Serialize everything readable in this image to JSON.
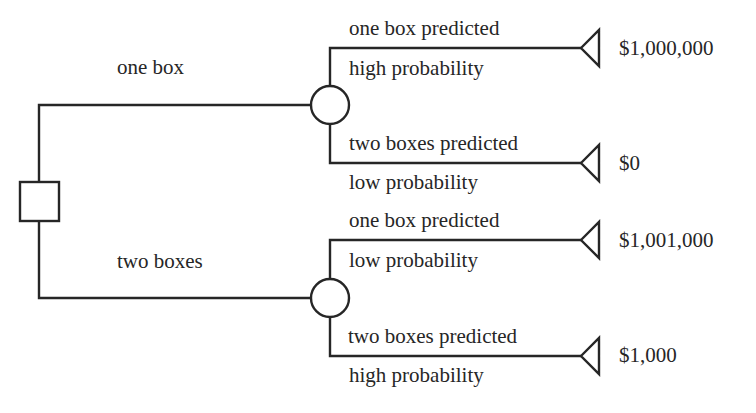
{
  "diagram": {
    "type": "decision-tree",
    "decision_node": {
      "shape": "square"
    },
    "choices": [
      {
        "label": "one box",
        "outcomes": [
          {
            "event": "one box predicted",
            "probability": "high probability",
            "payoff": "$1,000,000"
          },
          {
            "event": "two boxes predicted",
            "probability": "low probability",
            "payoff": "$0"
          }
        ]
      },
      {
        "label": "two boxes",
        "outcomes": [
          {
            "event": "one box predicted",
            "probability": "low probability",
            "payoff": "$1,001,000"
          },
          {
            "event": "two boxes predicted",
            "probability": "high probability",
            "payoff": "$1,000"
          }
        ]
      }
    ],
    "colors": {
      "line": "#262626",
      "background": "#ffffff"
    }
  }
}
